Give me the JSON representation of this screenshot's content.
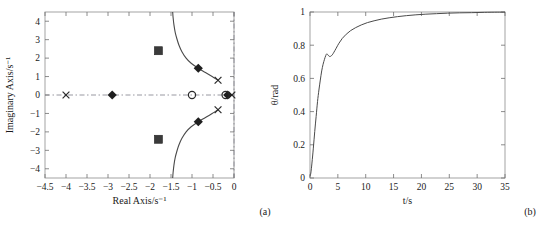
{
  "figure": {
    "panel_a_caption": "(a)",
    "panel_b_caption": "(b)"
  },
  "chart_data": [
    {
      "type": "scatter",
      "id": "panel-a",
      "title": "",
      "caption": "(a)",
      "xlabel": "Real Axis/s⁻¹",
      "ylabel": "Imaginary Axis/s⁻¹",
      "xlim": [
        -4.5,
        0
      ],
      "ylim": [
        -4.5,
        4.5
      ],
      "xticks": [
        -4.5,
        -4,
        -3.5,
        -3,
        -2.5,
        -2,
        -1.5,
        -1,
        -0.5,
        0
      ],
      "xticklabels": [
        "−4.5",
        "−4",
        "−3.5",
        "−3",
        "−2.5",
        "−2",
        "−1.5",
        "−1",
        "−0.5",
        "0"
      ],
      "yticks": [
        -4,
        -3,
        -2,
        -1,
        0,
        1,
        2,
        3,
        4
      ],
      "yticklabels": [
        "−4",
        "−3",
        "−2",
        "−1",
        "0",
        "1",
        "2",
        "3",
        "4"
      ],
      "grid": false,
      "legend": "none",
      "axis_lines": {
        "x_zero_dashed": true,
        "y_zero_dashed": true
      },
      "series": [
        {
          "name": "poles",
          "marker": "x",
          "points": [
            [
              -4.0,
              0.0
            ],
            [
              -0.38,
              0.8
            ],
            [
              -0.38,
              -0.8
            ],
            [
              -0.05,
              0.0
            ]
          ]
        },
        {
          "name": "closed-loop-roots",
          "marker": "diamond",
          "points": [
            [
              -2.9,
              0.0
            ],
            [
              -0.85,
              1.45
            ],
            [
              -0.85,
              -1.45
            ],
            [
              -0.15,
              0.0
            ]
          ]
        },
        {
          "name": "design-points",
          "marker": "square",
          "points": [
            [
              -1.8,
              2.4
            ],
            [
              -1.8,
              -2.4
            ]
          ]
        },
        {
          "name": "zeros",
          "marker": "circle",
          "points": [
            [
              -1.0,
              0.0
            ],
            [
              -0.2,
              0.0
            ]
          ]
        }
      ],
      "branches": [
        {
          "name": "upper-branch",
          "points": [
            [
              -0.38,
              0.8
            ],
            [
              -0.52,
              1.0
            ],
            [
              -0.68,
              1.22
            ],
            [
              -0.85,
              1.45
            ],
            [
              -1.02,
              1.72
            ],
            [
              -1.14,
              2.0
            ],
            [
              -1.24,
              2.35
            ],
            [
              -1.31,
              2.7
            ],
            [
              -1.36,
              3.05
            ],
            [
              -1.4,
              3.4
            ],
            [
              -1.43,
              3.8
            ],
            [
              -1.45,
              4.2
            ],
            [
              -1.46,
              4.5
            ]
          ]
        },
        {
          "name": "lower-branch",
          "points": [
            [
              -0.38,
              -0.8
            ],
            [
              -0.52,
              -1.0
            ],
            [
              -0.68,
              -1.22
            ],
            [
              -0.85,
              -1.45
            ],
            [
              -1.02,
              -1.72
            ],
            [
              -1.14,
              -2.0
            ],
            [
              -1.24,
              -2.35
            ],
            [
              -1.31,
              -2.7
            ],
            [
              -1.36,
              -3.05
            ],
            [
              -1.4,
              -3.4
            ],
            [
              -1.43,
              -3.8
            ],
            [
              -1.45,
              -4.2
            ],
            [
              -1.46,
              -4.5
            ]
          ]
        }
      ]
    },
    {
      "type": "line",
      "id": "panel-b",
      "title": "",
      "caption": "(b)",
      "xlabel": "t/s",
      "ylabel": "θ/rad",
      "xlim": [
        0,
        35
      ],
      "ylim": [
        0,
        1
      ],
      "xticks": [
        0,
        5,
        10,
        15,
        20,
        25,
        30,
        35
      ],
      "xticklabels": [
        "0",
        "5",
        "10",
        "15",
        "20",
        "25",
        "30",
        "35"
      ],
      "yticks": [
        0,
        0.2,
        0.4,
        0.6,
        0.8,
        1
      ],
      "yticklabels": [
        "0",
        "0.2",
        "0.4",
        "0.6",
        "0.8",
        "1"
      ],
      "grid": false,
      "legend": "none",
      "series": [
        {
          "name": "step-response",
          "x": [
            0,
            0.15,
            0.35,
            0.6,
            0.85,
            1.1,
            1.35,
            1.6,
            1.85,
            2.1,
            2.35,
            2.6,
            2.8,
            3.0,
            3.2,
            3.45,
            3.7,
            4.0,
            4.3,
            4.7,
            5.2,
            5.8,
            6.5,
            7.3,
            8.2,
            9.2,
            10.3,
            11.5,
            12.8,
            14.2,
            15.7,
            17.3,
            19.0,
            20.8,
            22.7,
            24.7,
            26.8,
            29.0,
            31.3,
            33.6,
            35
          ],
          "y": [
            0.01,
            0.03,
            0.09,
            0.18,
            0.28,
            0.37,
            0.46,
            0.53,
            0.59,
            0.645,
            0.685,
            0.715,
            0.735,
            0.748,
            0.742,
            0.733,
            0.733,
            0.742,
            0.758,
            0.782,
            0.812,
            0.841,
            0.866,
            0.888,
            0.906,
            0.922,
            0.936,
            0.947,
            0.957,
            0.965,
            0.972,
            0.978,
            0.983,
            0.987,
            0.99,
            0.993,
            0.995,
            0.996,
            0.998,
            0.999,
            0.999
          ]
        }
      ]
    }
  ]
}
